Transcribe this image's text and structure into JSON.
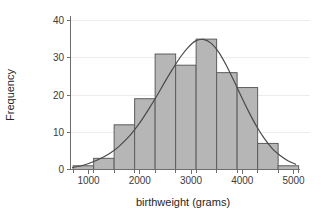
{
  "chart_data": {
    "type": "bar",
    "title": "",
    "subtitle": "",
    "xlabel": "birthweight (grams)",
    "ylabel": "Frequency",
    "xlim": [
      650,
      5100
    ],
    "ylim": [
      0,
      41
    ],
    "grid": true,
    "legend": null,
    "bin_width": 400,
    "x_ticks": [
      1000,
      2000,
      3000,
      4000,
      5000
    ],
    "x_tick_labels": [
      "1000",
      "2000",
      "3000",
      "4000",
      "5000"
    ],
    "y_ticks": [
      0,
      10,
      20,
      30,
      40
    ],
    "y_tick_labels": [
      "0",
      "10",
      "20",
      "30",
      "40"
    ],
    "bin_edges": [
      700,
      1100,
      1500,
      1900,
      2300,
      2700,
      3100,
      3500,
      3900,
      4300,
      4700,
      5100
    ],
    "bins": [
      {
        "x0": 700,
        "x1": 1100,
        "center": 900,
        "value": 1
      },
      {
        "x0": 1100,
        "x1": 1500,
        "center": 1300,
        "value": 3
      },
      {
        "x0": 1500,
        "x1": 1900,
        "center": 1700,
        "value": 12
      },
      {
        "x0": 1900,
        "x1": 2300,
        "center": 2100,
        "value": 19
      },
      {
        "x0": 2300,
        "x1": 2700,
        "center": 2500,
        "value": 31
      },
      {
        "x0": 2700,
        "x1": 3100,
        "center": 2900,
        "value": 28
      },
      {
        "x0": 3100,
        "x1": 3500,
        "center": 3300,
        "value": 35
      },
      {
        "x0": 3500,
        "x1": 3900,
        "center": 3700,
        "value": 26
      },
      {
        "x0": 3900,
        "x1": 4300,
        "center": 4100,
        "value": 22
      },
      {
        "x0": 4300,
        "x1": 4700,
        "center": 4500,
        "value": 7
      },
      {
        "x0": 4700,
        "x1": 5100,
        "center": 4900,
        "value": 1
      }
    ],
    "categories": [
      "900",
      "1300",
      "1700",
      "2100",
      "2500",
      "2900",
      "3300",
      "3700",
      "4100",
      "4500",
      "4900"
    ],
    "values": [
      1,
      3,
      12,
      19,
      31,
      28,
      35,
      26,
      22,
      7,
      1
    ],
    "overlay_curve": {
      "name": "normal density fit",
      "type": "line",
      "mean": 2950,
      "peak_value": 34.8,
      "points": [
        {
          "x": 700,
          "y": 0.4
        },
        {
          "x": 850,
          "y": 0.8
        },
        {
          "x": 1000,
          "y": 1.4
        },
        {
          "x": 1150,
          "y": 2.2
        },
        {
          "x": 1300,
          "y": 3.2
        },
        {
          "x": 1450,
          "y": 4.4
        },
        {
          "x": 1600,
          "y": 6.0
        },
        {
          "x": 1750,
          "y": 8.0
        },
        {
          "x": 1900,
          "y": 10.4
        },
        {
          "x": 2050,
          "y": 13.2
        },
        {
          "x": 2200,
          "y": 16.4
        },
        {
          "x": 2350,
          "y": 19.8
        },
        {
          "x": 2500,
          "y": 23.4
        },
        {
          "x": 2650,
          "y": 26.8
        },
        {
          "x": 2800,
          "y": 30.0
        },
        {
          "x": 2950,
          "y": 32.6
        },
        {
          "x": 3100,
          "y": 34.4
        },
        {
          "x": 3250,
          "y": 34.8
        },
        {
          "x": 3400,
          "y": 33.8
        },
        {
          "x": 3550,
          "y": 31.4
        },
        {
          "x": 3700,
          "y": 27.8
        },
        {
          "x": 3850,
          "y": 23.6
        },
        {
          "x": 4000,
          "y": 19.2
        },
        {
          "x": 4150,
          "y": 15.0
        },
        {
          "x": 4300,
          "y": 11.2
        },
        {
          "x": 4450,
          "y": 8.0
        },
        {
          "x": 4600,
          "y": 5.4
        },
        {
          "x": 4750,
          "y": 3.6
        },
        {
          "x": 4900,
          "y": 2.2
        },
        {
          "x": 5050,
          "y": 1.3
        }
      ]
    },
    "colors": {
      "bar_fill": "#b6b6b6",
      "bar_stroke": "#5d5d5d",
      "curve": "#4a4a4a",
      "axis": "#6e6e6e",
      "grid": "#ececec",
      "text": "#262626",
      "background": "#ffffff"
    }
  }
}
